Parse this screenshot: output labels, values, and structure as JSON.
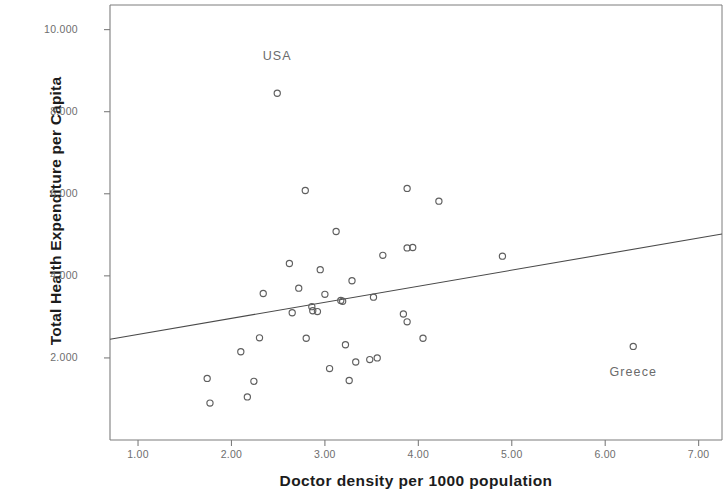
{
  "chart_data": {
    "type": "scatter",
    "title": "",
    "xlabel": "Doctor density per 1000 population",
    "ylabel": "Total Health Expenditure per Capita",
    "xlim": [
      0.7,
      7.25
    ],
    "ylim": [
      0,
      10600
    ],
    "grid": false,
    "legend": null,
    "xticks": [
      "1.00",
      "2.00",
      "3.00",
      "4.00",
      "5.00",
      "6.00",
      "7.00"
    ],
    "xtick_values": [
      1.0,
      2.0,
      3.0,
      4.0,
      5.0,
      6.0,
      7.0
    ],
    "yticks": [
      "2.000",
      "4.000",
      "6.000",
      "8.000",
      "10.000"
    ],
    "ytick_values": [
      2000,
      4000,
      6000,
      8000,
      10000
    ],
    "marker": "open-circle",
    "marker_color": "#5f5f5f",
    "frame_color": "#7d7d7d",
    "points": [
      {
        "x": 1.74,
        "y": 1500
      },
      {
        "x": 1.77,
        "y": 900
      },
      {
        "x": 2.1,
        "y": 2150
      },
      {
        "x": 2.17,
        "y": 1050
      },
      {
        "x": 2.24,
        "y": 1430
      },
      {
        "x": 2.34,
        "y": 3570
      },
      {
        "x": 2.3,
        "y": 2490
      },
      {
        "x": 2.49,
        "y": 8450
      },
      {
        "x": 2.62,
        "y": 4300
      },
      {
        "x": 2.65,
        "y": 3100
      },
      {
        "x": 2.72,
        "y": 3700
      },
      {
        "x": 2.79,
        "y": 6080
      },
      {
        "x": 2.8,
        "y": 2480
      },
      {
        "x": 2.86,
        "y": 3250
      },
      {
        "x": 2.87,
        "y": 3150
      },
      {
        "x": 2.92,
        "y": 3130
      },
      {
        "x": 2.95,
        "y": 4150
      },
      {
        "x": 3.0,
        "y": 3550
      },
      {
        "x": 3.05,
        "y": 1740
      },
      {
        "x": 3.12,
        "y": 5080
      },
      {
        "x": 3.17,
        "y": 3400
      },
      {
        "x": 3.19,
        "y": 3380
      },
      {
        "x": 3.22,
        "y": 2320
      },
      {
        "x": 3.26,
        "y": 1450
      },
      {
        "x": 3.29,
        "y": 3880
      },
      {
        "x": 3.33,
        "y": 1900
      },
      {
        "x": 3.48,
        "y": 1960
      },
      {
        "x": 3.52,
        "y": 3480
      },
      {
        "x": 3.56,
        "y": 2000
      },
      {
        "x": 3.62,
        "y": 4500
      },
      {
        "x": 3.88,
        "y": 6130
      },
      {
        "x": 3.84,
        "y": 3070
      },
      {
        "x": 3.88,
        "y": 2880
      },
      {
        "x": 3.88,
        "y": 4680
      },
      {
        "x": 3.94,
        "y": 4690
      },
      {
        "x": 4.05,
        "y": 2480
      },
      {
        "x": 4.22,
        "y": 5820
      },
      {
        "x": 4.9,
        "y": 4480
      },
      {
        "x": 6.3,
        "y": 2280
      }
    ],
    "annotations": [
      {
        "label": "USA",
        "x": 2.49,
        "y": 8450,
        "dx": 0,
        "dy": 880
      },
      {
        "label": "Greece",
        "x": 6.3,
        "y": 2280,
        "dx": 0,
        "dy": -640
      }
    ],
    "trendline": {
      "type": "linear",
      "x_start": 0.7,
      "y_start": 2455,
      "x_end": 7.25,
      "y_end": 5020,
      "color": "#4a4a4a"
    }
  }
}
